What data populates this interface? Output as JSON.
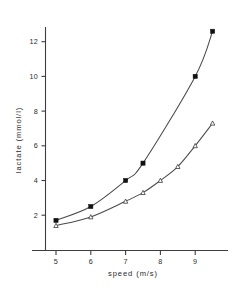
{
  "chart_data": {
    "type": "line",
    "title": "",
    "subtitle": "",
    "xlabel": "speed (m/s)",
    "ylabel": "lactate (mmol/l)",
    "xlim": [
      4.4,
      9.9
    ],
    "ylim": [
      0,
      13.4
    ],
    "xticks": [
      5,
      6,
      7,
      8,
      9
    ],
    "xticklabels": [
      "5",
      "6",
      "7",
      "8",
      "9"
    ],
    "yticks": [
      2,
      4,
      6,
      8,
      10,
      12
    ],
    "yticklabels": [
      "2",
      "4",
      "6",
      "8",
      "10",
      "12"
    ],
    "grid": false,
    "legend": "none",
    "series": [
      {
        "name": "upper curve",
        "marker": "filled-square",
        "x": [
          5.0,
          6.0,
          7.0,
          7.5,
          9.0,
          9.5
        ],
        "y": [
          1.7,
          2.5,
          4.0,
          5.0,
          10.0,
          12.6
        ]
      },
      {
        "name": "lower curve",
        "marker": "open-triangle",
        "x": [
          5.0,
          6.0,
          7.0,
          7.5,
          8.0,
          8.5,
          9.0,
          9.5
        ],
        "y": [
          1.4,
          1.9,
          2.8,
          3.3,
          4.0,
          4.8,
          6.0,
          7.3
        ]
      }
    ]
  },
  "figure": {
    "background_color": "#ffffff",
    "axis_color": "#3d3d3d",
    "curve_color": "#4a4a4a",
    "marker_color": "#111111"
  }
}
